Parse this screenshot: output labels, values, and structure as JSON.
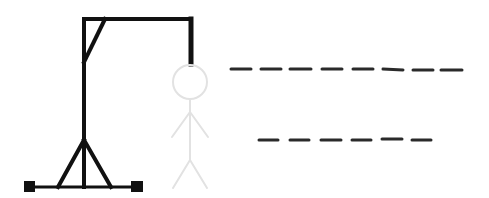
{
  "game": {
    "name": "hangman",
    "colors": {
      "gallows": "#111111",
      "figure": "#e2e2e2",
      "blank": "#2a2a2a",
      "background": "#ffffff"
    },
    "figure_state": "all-parts-faded",
    "words": [
      {
        "letters": 8,
        "revealed": [
          "",
          "",
          "",
          "",
          "",
          "",
          "",
          ""
        ]
      },
      {
        "letters": 6,
        "revealed": [
          "",
          "",
          "",
          "",
          "",
          ""
        ]
      }
    ]
  }
}
